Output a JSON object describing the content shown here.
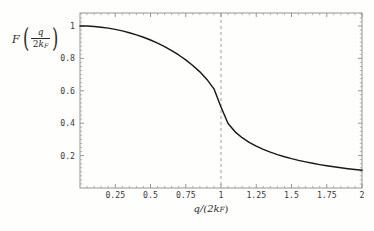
{
  "figure": {
    "background_color": "#fefefd",
    "frame_color": "#8a8a8a",
    "curve_color": "#181818",
    "marker_color": "#949494"
  },
  "axis_labels": {
    "y_function_name": "F",
    "y_numerator": "q",
    "y_denominator_coefficient": "2",
    "y_denominator_symbol": "k",
    "y_denominator_subscript": "F",
    "x_label_text": "q/(2k",
    "x_label_subscript": "F",
    "x_label_tail": ")"
  },
  "ticks": {
    "x_major_labels": [
      "0.25",
      "0.5",
      "0.75",
      "1",
      "1.25",
      "1.5",
      "1.75",
      "2"
    ],
    "x_major_values": [
      0.25,
      0.5,
      0.75,
      1,
      1.25,
      1.5,
      1.75,
      2
    ],
    "y_major_labels": [
      "0.2",
      "0.4",
      "0.6",
      "0.8",
      "1"
    ],
    "y_major_values": [
      0.2,
      0.4,
      0.6,
      0.8,
      1
    ]
  },
  "annotations": {
    "kink_marker_x": 1,
    "kink_marker_style": "dashed-vertical"
  },
  "chart_data": {
    "type": "line",
    "title": "",
    "xlabel": "q/(2k_F)",
    "ylabel": "F(q/(2k_F))",
    "xlim": [
      0,
      2
    ],
    "ylim": [
      0,
      1.08
    ],
    "grid": false,
    "legend": "none",
    "series": [
      {
        "name": "Lindhard screening function F(x) = 1/2 + (1-x^2)/(4x) * ln|(1+x)/(1-x)|",
        "x": [
          0.0,
          0.05,
          0.1,
          0.15,
          0.2,
          0.25,
          0.3,
          0.35,
          0.4,
          0.45,
          0.5,
          0.55,
          0.6,
          0.65,
          0.7,
          0.75,
          0.8,
          0.85,
          0.9,
          0.95,
          1.0,
          1.05,
          1.1,
          1.15,
          1.2,
          1.25,
          1.3,
          1.35,
          1.4,
          1.45,
          1.5,
          1.55,
          1.6,
          1.65,
          1.7,
          1.75,
          1.8,
          1.85,
          1.9,
          1.95,
          2.0
        ],
        "y": [
          1.0,
          0.9992,
          0.9967,
          0.9925,
          0.9866,
          0.979,
          0.9696,
          0.9584,
          0.9453,
          0.9303,
          0.9132,
          0.8939,
          0.8723,
          0.8481,
          0.821,
          0.7906,
          0.7562,
          0.7167,
          0.6702,
          0.6121,
          0.5,
          0.3981,
          0.3467,
          0.3104,
          0.2819,
          0.2584,
          0.2385,
          0.2213,
          0.2063,
          0.193,
          0.1812,
          0.1706,
          0.1611,
          0.1524,
          0.1445,
          0.1373,
          0.1307,
          0.1246,
          0.119,
          0.1138,
          0.109
        ]
      }
    ],
    "annotation_lines": [
      {
        "type": "vertical",
        "x": 1,
        "style": "dashed",
        "color": "#949494"
      }
    ]
  }
}
